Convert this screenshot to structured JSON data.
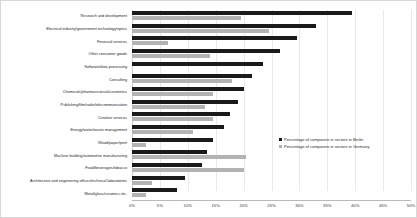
{
  "chart_data": {
    "type": "bar",
    "orientation": "horizontal",
    "title": "",
    "xlabel": "",
    "ylabel": "",
    "xlim": [
      0,
      50
    ],
    "xtick_labels": [
      "0%",
      "5%",
      "10%",
      "15%",
      "20%",
      "25%",
      "30%",
      "35%",
      "40%",
      "45%",
      "50%"
    ],
    "xtick_values": [
      0,
      5,
      10,
      15,
      20,
      25,
      30,
      35,
      40,
      45,
      50
    ],
    "grid": true,
    "legend_position": "center-right",
    "categories": [
      "Research and development",
      "Electrical industry/government technology/optics",
      "Financial services",
      "Other consumer goods",
      "Software/data processing",
      "Consulting",
      "Chemicals/pharmaceuticals/cosmetics",
      "Publishing/film/radio/telecommunication",
      "Creative services",
      "Energy/water/waste management",
      "Wood/paper/print",
      "Machine building/automotive manufacturing",
      "Food/beverages/tobacco",
      "Architecture and engineering offices/technical laboratories",
      "Metal/glass/ceramics etc."
    ],
    "series": [
      {
        "name": "Percentage of companies in sectors in Berlin",
        "color": "#1a1a1a",
        "values": [
          39.5,
          33.0,
          29.5,
          26.5,
          23.5,
          21.5,
          20.0,
          19.0,
          17.5,
          16.5,
          14.5,
          13.5,
          12.5,
          9.5,
          8.0
        ]
      },
      {
        "name": "Percentage of companies in sectors in Germany",
        "color": "#b3b3b3",
        "values": [
          19.5,
          24.5,
          6.5,
          14.0,
          0.0,
          18.0,
          14.5,
          13.0,
          14.5,
          11.0,
          2.5,
          20.5,
          20.0,
          3.5,
          2.5
        ]
      }
    ]
  },
  "legend": {
    "entries": [
      {
        "label": "Percentage of companies in sectors in Berlin",
        "swatch": "berlin"
      },
      {
        "label": "Percentage of companies in sectors in Germany",
        "swatch": "germany"
      }
    ]
  }
}
